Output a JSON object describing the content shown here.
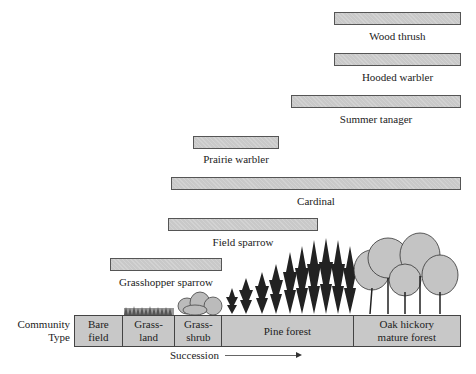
{
  "chart_data": {
    "type": "range-bar",
    "title": "",
    "xlabel": "Succession",
    "x_axis_label": "Community Type",
    "categories": [
      "Bare field",
      "Grass-land",
      "Grass-shrub",
      "Pine forest",
      "Oak hickory mature forest"
    ],
    "series": [
      {
        "name": "Wood thrush",
        "start": "Oak hickory mature forest",
        "end": "Oak hickory mature forest"
      },
      {
        "name": "Hooded warbler",
        "start": "Oak hickory mature forest",
        "end": "Oak hickory mature forest"
      },
      {
        "name": "Summer tanager",
        "start": "Pine forest (late)",
        "end": "Oak hickory mature forest"
      },
      {
        "name": "Prairie warbler",
        "start": "Grass-shrub (late)",
        "end": "Pine forest (mid)"
      },
      {
        "name": "Cardinal",
        "start": "Grass-shrub",
        "end": "Oak hickory mature forest"
      },
      {
        "name": "Field sparrow",
        "start": "Grass-shrub",
        "end": "Pine forest (mid)"
      },
      {
        "name": "Grasshopper sparrow",
        "start": "Grass-land (start)",
        "end": "Grass-shrub (end)"
      }
    ]
  },
  "species": [
    {
      "name": "Wood thrush",
      "x1": 334,
      "x2": 461,
      "y": 12,
      "ly": 30
    },
    {
      "name": "Hooded warbler",
      "x1": 334,
      "x2": 461,
      "y": 53,
      "ly": 71
    },
    {
      "name": "Summer tanager",
      "x1": 291,
      "x2": 461,
      "y": 95,
      "ly": 113
    },
    {
      "name": "Prairie warbler",
      "x1": 193,
      "x2": 279,
      "y": 136,
      "ly": 153
    },
    {
      "name": "Cardinal",
      "x1": 171,
      "x2": 461,
      "y": 177,
      "ly": 195
    },
    {
      "name": "Field sparrow",
      "x1": 168,
      "x2": 318,
      "y": 218,
      "ly": 236
    },
    {
      "name": "Grasshopper sparrow",
      "x1": 110,
      "x2": 222,
      "y": 258,
      "ly": 276
    }
  ],
  "community": {
    "label_line1": "Community",
    "label_line2": "Type",
    "cells": [
      {
        "line1": "Bare",
        "line2": "field",
        "width": 48
      },
      {
        "line1": "Grass-",
        "line2": "land",
        "width": 53
      },
      {
        "line1": "Grass-",
        "line2": "shrub",
        "width": 47
      },
      {
        "line1": "Pine forest",
        "line2": "",
        "width": 132
      },
      {
        "line1": "Oak hickory",
        "line2": "mature forest",
        "width": 107
      }
    ]
  },
  "succession_label": "Succession",
  "colors": {
    "bar_fill": "#c9c9c9",
    "bar_border": "#555555",
    "box_fill": "#c8c8c8"
  }
}
